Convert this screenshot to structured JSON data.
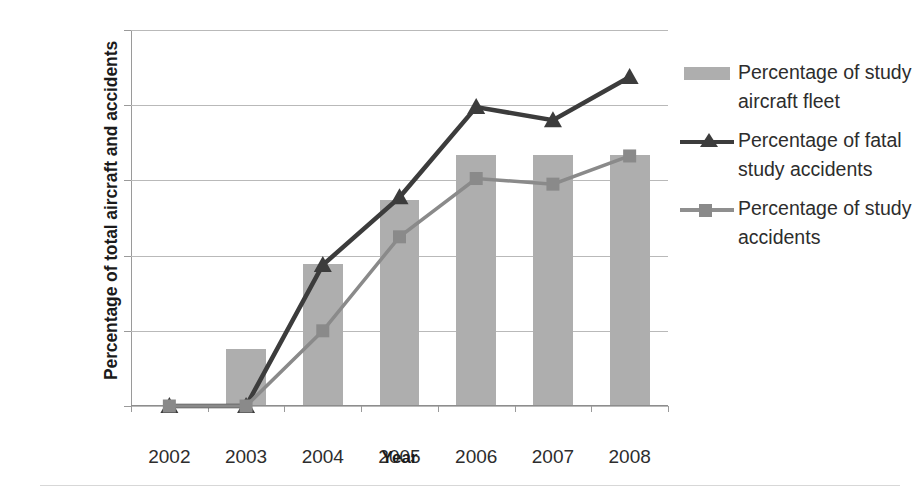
{
  "chart_data": {
    "type": "bar",
    "title": "",
    "xlabel": "Year",
    "ylabel": "Percentage of total aircraft and accidents",
    "categories": [
      "2002",
      "2003",
      "2004",
      "2005",
      "2006",
      "2007",
      "2008"
    ],
    "ylim": [
      0,
      100
    ],
    "ytick_labels": [
      "0%",
      "20%",
      "40%",
      "60%",
      "80%",
      "100%"
    ],
    "ytick_values": [
      0,
      20,
      40,
      60,
      80,
      100
    ],
    "grid": true,
    "legend_position": "right",
    "series": [
      {
        "name": "Percentage of study aircraft fleet",
        "type": "bar",
        "color": "#aeaeae",
        "values": [
          0,
          15,
          37.5,
          54.5,
          66.5,
          66.5,
          66.5
        ]
      },
      {
        "name": "Percentage of fatal study accidents",
        "type": "line",
        "marker": "triangle",
        "color": "#3c3c3c",
        "values": [
          0,
          0,
          37.5,
          55.5,
          79.5,
          76,
          87.5
        ]
      },
      {
        "name": "Percentage of study accidents",
        "type": "line",
        "marker": "square",
        "color": "#8a8a8a",
        "values": [
          0,
          0,
          20,
          45,
          60.5,
          59,
          66.5
        ]
      }
    ]
  },
  "legend": {
    "items": [
      {
        "label": "Percentage of study aircraft fleet",
        "icon": "bar-swatch"
      },
      {
        "label": "Percentage of fatal study accidents",
        "icon": "line-triangle-swatch"
      },
      {
        "label": "Percentage of study accidents",
        "icon": "line-square-swatch"
      }
    ]
  },
  "axes": {
    "x_title": "Year",
    "y_title": "Percentage of total aircraft and accidents"
  }
}
